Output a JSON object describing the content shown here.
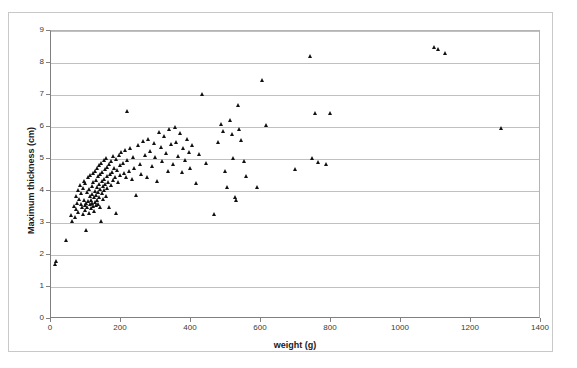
{
  "chart_data": {
    "type": "scatter",
    "title": "",
    "xlabel": "weight (g)",
    "ylabel": "Maximum thickness (cm)",
    "xlim": [
      0,
      1400
    ],
    "ylim": [
      0,
      9
    ],
    "xticks": [
      0,
      200,
      400,
      600,
      800,
      1000,
      1200,
      1400
    ],
    "yticks": [
      0,
      1,
      2,
      3,
      4,
      5,
      6,
      7,
      8,
      9
    ],
    "grid": "horizontal",
    "legend": "none",
    "marker": "triangle",
    "marker_color": "#111111",
    "series": [
      {
        "name": "specimens",
        "points": [
          [
            12,
            1.72
          ],
          [
            16,
            1.8
          ],
          [
            45,
            2.47
          ],
          [
            60,
            3.25
          ],
          [
            63,
            3.05
          ],
          [
            66,
            3.52
          ],
          [
            70,
            3.18
          ],
          [
            72,
            3.85
          ],
          [
            74,
            3.42
          ],
          [
            76,
            3.62
          ],
          [
            78,
            3.33
          ],
          [
            80,
            4.02
          ],
          [
            82,
            3.75
          ],
          [
            84,
            4.18
          ],
          [
            86,
            3.58
          ],
          [
            88,
            3.92
          ],
          [
            90,
            3.48
          ],
          [
            92,
            4.1
          ],
          [
            93,
            3.28
          ],
          [
            95,
            3.7
          ],
          [
            96,
            4.32
          ],
          [
            98,
            3.55
          ],
          [
            99,
            3.4
          ],
          [
            100,
            4.25
          ],
          [
            101,
            3.62
          ],
          [
            102,
            2.78
          ],
          [
            104,
            3.95
          ],
          [
            105,
            3.5
          ],
          [
            106,
            4.42
          ],
          [
            108,
            3.68
          ],
          [
            110,
            3.3
          ],
          [
            111,
            4.05
          ],
          [
            112,
            3.85
          ],
          [
            113,
            3.58
          ],
          [
            114,
            4.48
          ],
          [
            115,
            3.72
          ],
          [
            116,
            3.45
          ],
          [
            118,
            4.15
          ],
          [
            119,
            3.9
          ],
          [
            120,
            3.62
          ],
          [
            121,
            4.55
          ],
          [
            122,
            3.52
          ],
          [
            123,
            4.28
          ],
          [
            124,
            3.8
          ],
          [
            125,
            3.38
          ],
          [
            126,
            4.62
          ],
          [
            127,
            4.0
          ],
          [
            128,
            3.65
          ],
          [
            129,
            4.35
          ],
          [
            130,
            3.88
          ],
          [
            131,
            3.55
          ],
          [
            132,
            4.7
          ],
          [
            133,
            4.12
          ],
          [
            134,
            3.72
          ],
          [
            135,
            4.45
          ],
          [
            136,
            3.95
          ],
          [
            137,
            3.6
          ],
          [
            138,
            4.8
          ],
          [
            139,
            4.22
          ],
          [
            140,
            3.82
          ],
          [
            141,
            4.52
          ],
          [
            142,
            4.05
          ],
          [
            143,
            3.5
          ],
          [
            144,
            3.05
          ],
          [
            145,
            4.88
          ],
          [
            146,
            4.3
          ],
          [
            147,
            3.92
          ],
          [
            148,
            4.6
          ],
          [
            149,
            4.15
          ],
          [
            150,
            3.75
          ],
          [
            152,
            4.95
          ],
          [
            153,
            4.38
          ],
          [
            154,
            4.02
          ],
          [
            155,
            4.68
          ],
          [
            156,
            4.22
          ],
          [
            158,
            3.85
          ],
          [
            160,
            5.02
          ],
          [
            161,
            4.45
          ],
          [
            162,
            4.1
          ],
          [
            163,
            4.75
          ],
          [
            164,
            4.28
          ],
          [
            166,
            3.48
          ],
          [
            168,
            4.85
          ],
          [
            170,
            4.52
          ],
          [
            172,
            4.18
          ],
          [
            174,
            4.92
          ],
          [
            176,
            4.6
          ],
          [
            178,
            4.35
          ],
          [
            180,
            5.08
          ],
          [
            182,
            4.72
          ],
          [
            184,
            4.42
          ],
          [
            186,
            3.32
          ],
          [
            188,
            4.98
          ],
          [
            190,
            4.65
          ],
          [
            192,
            4.28
          ],
          [
            195,
            5.12
          ],
          [
            198,
            4.8
          ],
          [
            200,
            4.48
          ],
          [
            203,
            5.2
          ],
          [
            206,
            4.88
          ],
          [
            210,
            4.55
          ],
          [
            213,
            5.28
          ],
          [
            216,
            4.42
          ],
          [
            218,
            6.48
          ],
          [
            220,
            4.95
          ],
          [
            225,
            4.62
          ],
          [
            228,
            5.35
          ],
          [
            232,
            4.38
          ],
          [
            236,
            5.05
          ],
          [
            240,
            4.7
          ],
          [
            245,
            3.88
          ],
          [
            250,
            5.42
          ],
          [
            255,
            4.85
          ],
          [
            260,
            4.52
          ],
          [
            265,
            5.55
          ],
          [
            270,
            5.12
          ],
          [
            275,
            4.42
          ],
          [
            280,
            5.62
          ],
          [
            285,
            5.25
          ],
          [
            290,
            4.78
          ],
          [
            295,
            5.48
          ],
          [
            300,
            5.05
          ],
          [
            305,
            4.3
          ],
          [
            310,
            5.85
          ],
          [
            315,
            5.38
          ],
          [
            320,
            4.92
          ],
          [
            325,
            5.7
          ],
          [
            330,
            5.18
          ],
          [
            335,
            4.62
          ],
          [
            340,
            5.92
          ],
          [
            345,
            5.45
          ],
          [
            350,
            4.85
          ],
          [
            355,
            5.98
          ],
          [
            360,
            5.52
          ],
          [
            365,
            5.08
          ],
          [
            370,
            5.8
          ],
          [
            375,
            4.58
          ],
          [
            380,
            5.35
          ],
          [
            385,
            4.95
          ],
          [
            390,
            5.62
          ],
          [
            395,
            5.2
          ],
          [
            400,
            4.72
          ],
          [
            405,
            5.42
          ],
          [
            415,
            4.25
          ],
          [
            425,
            5.15
          ],
          [
            432,
            7.02
          ],
          [
            445,
            4.88
          ],
          [
            468,
            3.28
          ],
          [
            478,
            5.52
          ],
          [
            488,
            6.08
          ],
          [
            492,
            5.88
          ],
          [
            500,
            4.62
          ],
          [
            505,
            4.12
          ],
          [
            512,
            6.22
          ],
          [
            518,
            5.78
          ],
          [
            522,
            5.02
          ],
          [
            528,
            3.82
          ],
          [
            530,
            3.7
          ],
          [
            535,
            6.68
          ],
          [
            540,
            5.92
          ],
          [
            545,
            5.58
          ],
          [
            552,
            4.92
          ],
          [
            558,
            4.45
          ],
          [
            590,
            4.12
          ],
          [
            605,
            7.45
          ],
          [
            615,
            6.05
          ],
          [
            700,
            4.68
          ],
          [
            742,
            8.2
          ],
          [
            748,
            5.02
          ],
          [
            755,
            6.42
          ],
          [
            765,
            4.9
          ],
          [
            788,
            4.85
          ],
          [
            800,
            6.42
          ],
          [
            1095,
            8.48
          ],
          [
            1108,
            8.42
          ],
          [
            1128,
            8.3
          ],
          [
            1288,
            5.95
          ]
        ]
      }
    ]
  }
}
